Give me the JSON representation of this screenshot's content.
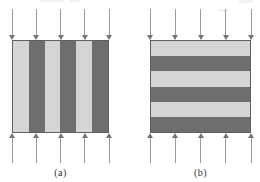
{
  "figure": {
    "loading": "compression-vertical"
  },
  "colors": {
    "background": "#ffffff",
    "stripe_light": "#d5d5d5",
    "stripe_dark": "#6e6e6e",
    "square_border": "#606060",
    "arrow_shaft": "#9a9a9a",
    "arrow_head": "#757575",
    "label_text": "#2f2f2f",
    "artifact": "#f2f2f2"
  },
  "panels": [
    {
      "id": "a",
      "label": "(a)",
      "stripe_orientation": "vertical",
      "stripe_count": 6,
      "first_stripe": "light",
      "arrows_top": 5,
      "arrows_bottom": 5,
      "arrow_direction_top": "down",
      "arrow_direction_bottom": "up"
    },
    {
      "id": "b",
      "label": "(b)",
      "stripe_orientation": "horizontal",
      "stripe_count": 6,
      "first_stripe": "light",
      "arrows_top": 5,
      "arrows_bottom": 5,
      "arrow_direction_top": "down",
      "arrow_direction_bottom": "up"
    }
  ]
}
